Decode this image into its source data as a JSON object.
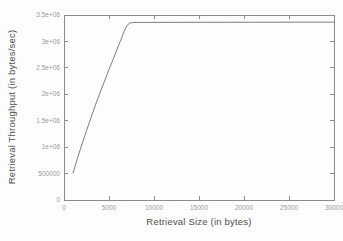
{
  "chart_data": {
    "type": "line",
    "title": "",
    "xlabel": "Retrieval Size (in bytes)",
    "ylabel": "Retrieval Throughput (in bytes/sec)",
    "xlim": [
      0,
      30000
    ],
    "ylim": [
      0,
      3500000
    ],
    "grid": false,
    "legend": "none",
    "frame": "box-with-inward-mirrored-ticks",
    "x_ticks": [
      0,
      5000,
      10000,
      15000,
      20000,
      25000,
      30000
    ],
    "x_tick_labels": [
      "0",
      "5000",
      "10000",
      "15000",
      "20000",
      "25000",
      "30000"
    ],
    "y_ticks": [
      0,
      500000,
      1000000,
      1500000,
      2000000,
      2500000,
      3000000,
      3500000
    ],
    "y_tick_labels": [
      "0",
      "500000",
      "1e+06",
      "1.5e+06",
      "2e+06",
      "2.5e+06",
      "3e+06",
      "3.5e+06"
    ],
    "series": [
      {
        "name": "retrieval-throughput",
        "x": [
          1000,
          1500,
          2000,
          2500,
          3000,
          3500,
          4000,
          4500,
          5000,
          5500,
          6000,
          6250,
          6500,
          6750,
          7000,
          7250,
          7500,
          8000,
          9000,
          10000,
          12000,
          14000,
          16000,
          18000,
          20000,
          22000,
          24000,
          26000,
          28000,
          30000
        ],
        "y": [
          510000,
          790000,
          1060000,
          1310000,
          1560000,
          1800000,
          2030000,
          2250000,
          2470000,
          2680000,
          2900000,
          3000000,
          3110000,
          3220000,
          3300000,
          3340000,
          3355000,
          3360000,
          3360000,
          3360000,
          3361000,
          3362000,
          3362000,
          3363000,
          3363000,
          3364000,
          3364000,
          3365000,
          3365000,
          3365000
        ]
      }
    ],
    "colors": {
      "line_color": "#6e6e6e",
      "frame_color": "#8c8c8c",
      "tick_label_color": "#9a9a9a",
      "axis_title_color": "#4f4f4f",
      "background": "#fdfdfd"
    }
  }
}
